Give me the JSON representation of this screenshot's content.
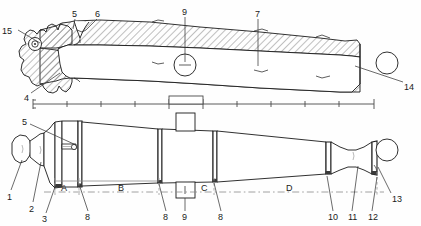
{
  "figure": {
    "type": "technical-engineering-drawing",
    "views": [
      {
        "name": "sectional-view",
        "position": "top",
        "shading": "hatched"
      },
      {
        "name": "side-elevation",
        "position": "bottom",
        "shading": "outline"
      }
    ],
    "background_color": "#ffffff",
    "line_color": "#1a1a1a",
    "hatch_color": "#555555",
    "dashed_color": "#777777"
  },
  "callouts": [
    {
      "id": "c15",
      "label": "15",
      "x": 2,
      "y": 27,
      "leader": {
        "x1": 18,
        "y1": 30,
        "x2": 40,
        "y2": 43
      }
    },
    {
      "id": "c5t",
      "label": "5",
      "x": 72,
      "y": 10,
      "leader": {
        "x1": 75,
        "y1": 19,
        "x2": 73,
        "y2": 29
      }
    },
    {
      "id": "c6",
      "label": "6",
      "x": 95,
      "y": 10,
      "leader": {
        "x1": 97,
        "y1": 19,
        "x2": 86,
        "y2": 30
      }
    },
    {
      "id": "c9t",
      "label": "9",
      "x": 182,
      "y": 8,
      "leader": {
        "x1": 185,
        "y1": 17,
        "x2": 185,
        "y2": 62
      }
    },
    {
      "id": "c7",
      "label": "7",
      "x": 255,
      "y": 10,
      "leader": {
        "x1": 258,
        "y1": 19,
        "x2": 258,
        "y2": 66
      }
    },
    {
      "id": "c14",
      "label": "14",
      "x": 404,
      "y": 83,
      "leader": {
        "x1": 403,
        "y1": 82,
        "x2": 355,
        "y2": 66
      }
    },
    {
      "id": "c4",
      "label": "4",
      "x": 24,
      "y": 94,
      "leader": {
        "x1": 31,
        "y1": 93,
        "x2": 60,
        "y2": 73
      }
    },
    {
      "id": "c5b",
      "label": "5",
      "x": 22,
      "y": 118,
      "leader": {
        "x1": 30,
        "y1": 124,
        "x2": 76,
        "y2": 143
      }
    },
    {
      "id": "c1",
      "label": "1",
      "x": 7,
      "y": 193,
      "leader": {
        "x1": 11,
        "y1": 190,
        "x2": 22,
        "y2": 160
      }
    },
    {
      "id": "c2",
      "label": "2",
      "x": 29,
      "y": 205,
      "leader": {
        "x1": 33,
        "y1": 202,
        "x2": 41,
        "y2": 162
      }
    },
    {
      "id": "c3",
      "label": "3",
      "x": 42,
      "y": 216,
      "leader": {
        "x1": 46,
        "y1": 213,
        "x2": 54,
        "y2": 186
      }
    },
    {
      "id": "c8a",
      "label": "8",
      "x": 85,
      "y": 213,
      "leader": {
        "x1": 88,
        "y1": 211,
        "x2": 79,
        "y2": 186
      }
    },
    {
      "id": "c8b",
      "label": "8",
      "x": 163,
      "y": 213,
      "leader": {
        "x1": 166,
        "y1": 211,
        "x2": 158,
        "y2": 186
      }
    },
    {
      "id": "c9b",
      "label": "9",
      "x": 182,
      "y": 213,
      "leader": {
        "x1": 185,
        "y1": 211,
        "x2": 185,
        "y2": 190
      }
    },
    {
      "id": "c8c",
      "label": "8",
      "x": 218,
      "y": 213,
      "leader": {
        "x1": 221,
        "y1": 211,
        "x2": 213,
        "y2": 186
      }
    },
    {
      "id": "c10",
      "label": "10",
      "x": 328,
      "y": 213,
      "leader": {
        "x1": 333,
        "y1": 211,
        "x2": 326,
        "y2": 180
      }
    },
    {
      "id": "c11",
      "label": "11",
      "x": 348,
      "y": 213,
      "leader": {
        "x1": 352,
        "y1": 211,
        "x2": 358,
        "y2": 170
      }
    },
    {
      "id": "c12",
      "label": "12",
      "x": 368,
      "y": 213,
      "leader": {
        "x1": 372,
        "y1": 211,
        "x2": 378,
        "y2": 178
      }
    },
    {
      "id": "c13",
      "label": "13",
      "x": 392,
      "y": 195,
      "leader": {
        "x1": 391,
        "y1": 193,
        "x2": 378,
        "y2": 168
      }
    }
  ],
  "segments": [
    {
      "id": "segA",
      "label": "A",
      "x": 61,
      "y": 186
    },
    {
      "id": "segB",
      "label": "B",
      "x": 118,
      "y": 186
    },
    {
      "id": "segC",
      "label": "C",
      "x": 201,
      "y": 186
    },
    {
      "id": "segD",
      "label": "D",
      "x": 286,
      "y": 186
    }
  ],
  "scale_bar": {
    "y": 104,
    "x_start": 33,
    "x_end": 374,
    "tick_count": 11,
    "tick_positions": [
      33,
      67,
      101,
      135,
      169,
      203,
      237,
      271,
      305,
      339,
      374
    ],
    "block_start": 169,
    "block_end": 203,
    "block_top": 96
  },
  "section_circles": [
    {
      "id": "circle-top",
      "cx": 387,
      "cy": 63,
      "r": 11
    },
    {
      "id": "circle-bottom",
      "cx": 387,
      "cy": 150,
      "r": 11
    }
  ]
}
